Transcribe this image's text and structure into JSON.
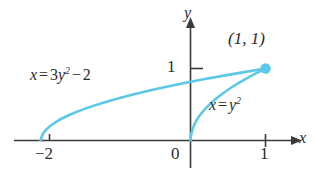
{
  "figure": {
    "background_color": "#ffffff",
    "curve_color": "#5BC8E8",
    "axis_color": "#3a3a3a",
    "text_color": "#2b2b2b"
  },
  "axes": {
    "x_axis_label": "x",
    "y_axis_label": "y",
    "origin_label": "0",
    "x_ticks": [
      {
        "value": -2,
        "label": "−2"
      },
      {
        "value": 1,
        "label": "1"
      }
    ],
    "y_ticks": [
      {
        "value": 1,
        "label": "1"
      }
    ]
  },
  "labels": {
    "intersection_point": "(1, 1)",
    "curve_a": {
      "lhs": "x",
      "eq": "=",
      "coef": "3",
      "var": "y",
      "exp": "2",
      "op": "−",
      "const": "2"
    },
    "curve_b": {
      "lhs": "x",
      "eq": "=",
      "var": "y",
      "exp": "2"
    }
  },
  "chart_data": {
    "type": "line",
    "title": "",
    "xlabel": "x",
    "ylabel": "y",
    "xlim": [
      -2.6,
      1.55
    ],
    "ylim": [
      -0.45,
      1.6
    ],
    "grid": false,
    "legend": "none",
    "series": [
      {
        "name": "x = 3y² − 2",
        "equation": "x = 3*y^2 - 2",
        "color": "#5BC8E8",
        "points": [
          {
            "x": -2.0,
            "y": 0.0
          },
          {
            "x": -1.97,
            "y": 0.1
          },
          {
            "x": -1.88,
            "y": 0.2
          },
          {
            "x": -1.73,
            "y": 0.3
          },
          {
            "x": -1.52,
            "y": 0.4
          },
          {
            "x": -1.25,
            "y": 0.5
          },
          {
            "x": -0.92,
            "y": 0.6
          },
          {
            "x": -0.53,
            "y": 0.7
          },
          {
            "x": -0.08,
            "y": 0.8
          },
          {
            "x": 0.43,
            "y": 0.9
          },
          {
            "x": 1.0,
            "y": 1.0
          }
        ]
      },
      {
        "name": "x = y²",
        "equation": "x = y^2",
        "color": "#5BC8E8",
        "points": [
          {
            "x": 0.0,
            "y": 0.0
          },
          {
            "x": 0.01,
            "y": 0.1
          },
          {
            "x": 0.04,
            "y": 0.2
          },
          {
            "x": 0.09,
            "y": 0.3
          },
          {
            "x": 0.16,
            "y": 0.4
          },
          {
            "x": 0.25,
            "y": 0.5
          },
          {
            "x": 0.36,
            "y": 0.6
          },
          {
            "x": 0.49,
            "y": 0.7
          },
          {
            "x": 0.64,
            "y": 0.8
          },
          {
            "x": 0.81,
            "y": 0.9
          },
          {
            "x": 1.0,
            "y": 1.0
          }
        ]
      }
    ],
    "annotations": [
      {
        "text": "(1, 1)",
        "x": 1.0,
        "y": 1.0,
        "kind": "point-label"
      },
      {
        "text": "x = 3y² − 2",
        "x": -1.45,
        "y": 0.95,
        "kind": "curve-label"
      },
      {
        "text": "x = y²",
        "x": 0.45,
        "y": 0.58,
        "kind": "curve-label"
      }
    ],
    "markers": [
      {
        "x": 1.0,
        "y": 1.0,
        "shape": "circle",
        "filled": true,
        "color": "#5BC8E8"
      }
    ]
  }
}
